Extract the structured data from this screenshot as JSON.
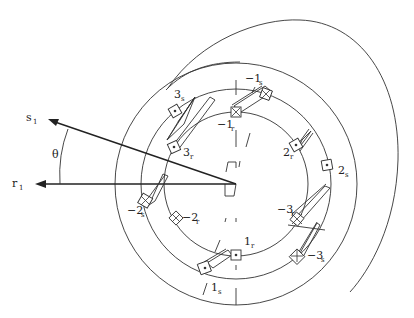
{
  "figure": {
    "axes": {
      "stator_axis": {
        "label": "s",
        "subscript": "1"
      },
      "rotor_axis": {
        "label": "r",
        "subscript": "1"
      },
      "angle": {
        "label": "θ"
      }
    },
    "stator_conductors": [
      {
        "name": "1s",
        "main": "1",
        "sub": "s",
        "type": "dot"
      },
      {
        "name": "-1s",
        "main": "−1",
        "sub": "s",
        "type": "cross"
      },
      {
        "name": "2s",
        "main": "2",
        "sub": "s",
        "type": "dot"
      },
      {
        "name": "-2s",
        "main": "−2",
        "sub": "s",
        "type": "cross"
      },
      {
        "name": "3s",
        "main": "3",
        "sub": "s",
        "type": "dot"
      },
      {
        "name": "-3s",
        "main": "−3",
        "sub": "s",
        "type": "cross"
      }
    ],
    "rotor_conductors": [
      {
        "name": "1r",
        "main": "1",
        "sub": "r",
        "type": "dot"
      },
      {
        "name": "-1r",
        "main": "−1",
        "sub": "r",
        "type": "cross"
      },
      {
        "name": "2r",
        "main": "2",
        "sub": "r",
        "type": "dot"
      },
      {
        "name": "-2r",
        "main": "−2",
        "sub": "r",
        "type": "cross"
      },
      {
        "name": "3r",
        "main": "3",
        "sub": "r",
        "type": "dot"
      },
      {
        "name": "-3r",
        "main": "−3",
        "sub": "r",
        "type": "cross"
      }
    ]
  }
}
